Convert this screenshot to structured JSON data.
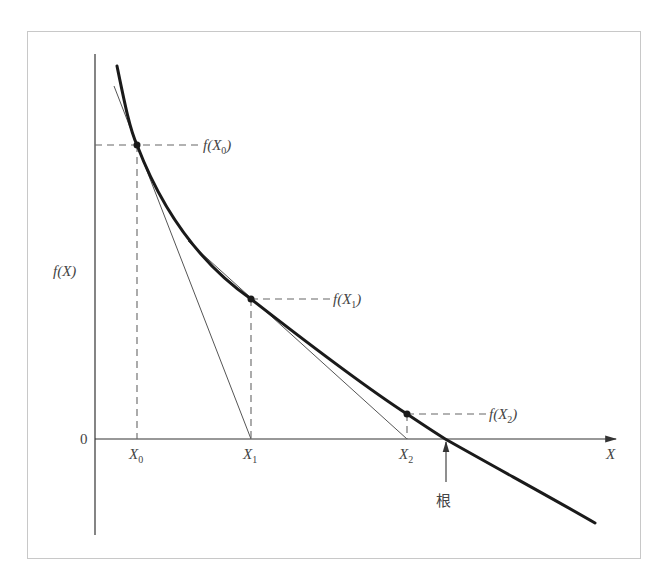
{
  "figure": {
    "y_axis_label": "f(X)",
    "x_axis_label": "X",
    "origin_label": "0",
    "root_label": "根",
    "iterates": [
      {
        "x_label_base": "X",
        "x_label_sub": "0",
        "f_label_prefix": "f(X",
        "f_label_sub": "0",
        "f_label_suffix": ")"
      },
      {
        "x_label_base": "X",
        "x_label_sub": "1",
        "f_label_prefix": "f(X",
        "f_label_sub": "1",
        "f_label_suffix": ")"
      },
      {
        "x_label_base": "X",
        "x_label_sub": "2",
        "f_label_prefix": "f(X",
        "f_label_sub": "2",
        "f_label_suffix": ")"
      }
    ],
    "colors": {
      "curve": "#1a1a1a",
      "tangent": "#555555",
      "dashed": "#666666",
      "axis": "#333333",
      "frame": "#c8c8c8",
      "text": "#444444"
    }
  }
}
